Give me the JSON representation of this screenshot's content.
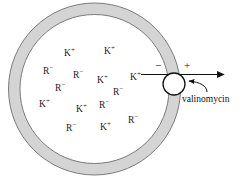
{
  "figure": {
    "membrane": {
      "fill_color": "#d4d4d4",
      "stroke_color": "#6e6e6e",
      "interior_color": "#ffffff"
    },
    "interior_ions": [
      {
        "species": "K",
        "charge": "+",
        "x": 64,
        "y": 49
      },
      {
        "species": "K",
        "charge": "+",
        "x": 104,
        "y": 47
      },
      {
        "species": "R",
        "charge": "-",
        "x": 43,
        "y": 67
      },
      {
        "species": "R",
        "charge": "-",
        "x": 73,
        "y": 71
      },
      {
        "species": "K",
        "charge": "+",
        "x": 97,
        "y": 76
      },
      {
        "species": "K",
        "charge": "+",
        "x": 130,
        "y": 73
      },
      {
        "species": "R",
        "charge": "-",
        "x": 55,
        "y": 84
      },
      {
        "species": "R",
        "charge": "-",
        "x": 113,
        "y": 88
      },
      {
        "species": "K",
        "charge": "+",
        "x": 39,
        "y": 100
      },
      {
        "species": "K",
        "charge": "+",
        "x": 76,
        "y": 105
      },
      {
        "species": "R",
        "charge": "-",
        "x": 99,
        "y": 101
      },
      {
        "species": "R",
        "charge": "-",
        "x": 128,
        "y": 116
      },
      {
        "species": "R",
        "charge": "-",
        "x": 66,
        "y": 124
      },
      {
        "species": "K",
        "charge": "+",
        "x": 100,
        "y": 123
      }
    ],
    "membrane_potential": {
      "inside_sign": "−",
      "outside_sign": "+"
    },
    "carrier": {
      "label": "valinomycin"
    },
    "caption": ""
  }
}
